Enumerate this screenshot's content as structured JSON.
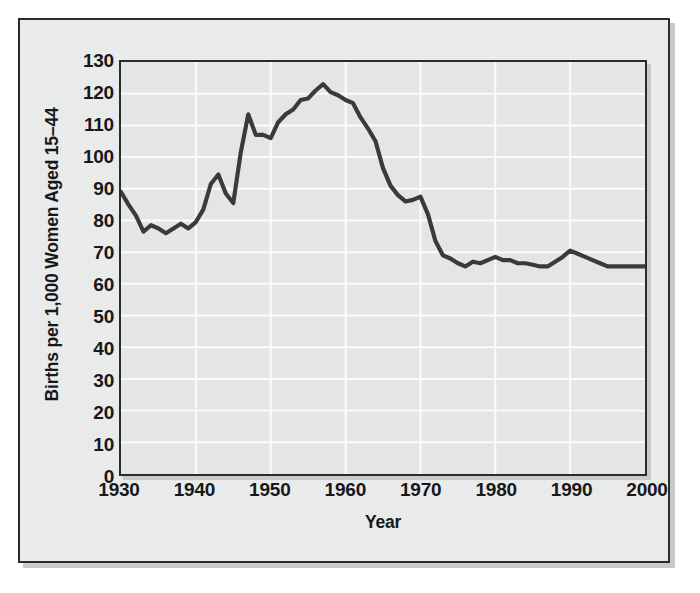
{
  "chart_data": {
    "type": "line",
    "title": "",
    "xlabel": "Year",
    "ylabel": "Births per 1,000 Women Aged 15–44",
    "xlim": [
      1930,
      2000
    ],
    "ylim": [
      0,
      130
    ],
    "xticks": [
      1930,
      1940,
      1950,
      1960,
      1970,
      1980,
      1990,
      2000
    ],
    "yticks": [
      0,
      10,
      20,
      30,
      40,
      50,
      60,
      70,
      80,
      90,
      100,
      110,
      120,
      130
    ],
    "grid": "both-white-lines",
    "legend": "none",
    "line_color": "#3a3a3a",
    "plot_background": "#e4e6e6",
    "panel_background": "#eceded",
    "frame_color": "#2b2b2b",
    "series": [
      {
        "name": "Fertility rate",
        "x": [
          1930,
          1931,
          1932,
          1933,
          1934,
          1935,
          1936,
          1937,
          1938,
          1939,
          1940,
          1941,
          1942,
          1943,
          1944,
          1945,
          1946,
          1947,
          1948,
          1949,
          1950,
          1951,
          1952,
          1953,
          1954,
          1955,
          1956,
          1957,
          1958,
          1959,
          1960,
          1961,
          1962,
          1963,
          1964,
          1965,
          1966,
          1967,
          1968,
          1969,
          1970,
          1971,
          1972,
          1973,
          1974,
          1975,
          1976,
          1977,
          1978,
          1979,
          1980,
          1981,
          1982,
          1983,
          1984,
          1985,
          1986,
          1987,
          1988,
          1989,
          1990,
          1991,
          1992,
          1993,
          1994,
          1995,
          1996,
          1997,
          1998,
          1999,
          2000
        ],
        "y": [
          89,
          85,
          81.5,
          76.5,
          78.5,
          77.5,
          76,
          77.5,
          79,
          77.5,
          79.5,
          83.5,
          91.5,
          94.5,
          88.5,
          85.5,
          101.5,
          113.5,
          107,
          107,
          106,
          111,
          113.5,
          115,
          118,
          118.5,
          121,
          123,
          120.5,
          119.5,
          118,
          117,
          112.5,
          109,
          105,
          96.5,
          91,
          88,
          86,
          86.5,
          87.5,
          82,
          73.5,
          69,
          68,
          66.5,
          65.5,
          67,
          66.5,
          67.5,
          68.5,
          67.5,
          67.5,
          66.5,
          66.5,
          66,
          65.5,
          65.5,
          67,
          68.5,
          70.5,
          69.5,
          68.5,
          67.5,
          66.5,
          65.5,
          65.5,
          65.5,
          65.5,
          65.5,
          65.5
        ]
      }
    ]
  },
  "axes": {
    "y_tick_labels": [
      "130",
      "120",
      "110",
      "100",
      "90",
      "80",
      "70",
      "60",
      "50",
      "40",
      "30",
      "20",
      "10",
      "0"
    ],
    "x_tick_labels": [
      "1930",
      "1940",
      "1950",
      "1960",
      "1970",
      "1980",
      "1990",
      "2000"
    ],
    "y_title": "Births per 1,000 Women Aged 15–44",
    "x_title": "Year"
  }
}
